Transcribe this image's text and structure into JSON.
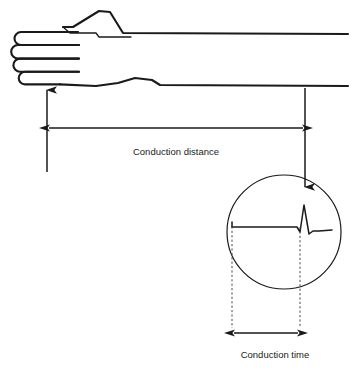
{
  "diagram": {
    "background_color": "#ffffff",
    "line_color": "#1a1a1a",
    "labels": {
      "conduction_distance": "Conduction distance",
      "conduction_time": "Conduction time"
    },
    "parts": {
      "hand_arm": "hand-and-forearm-outline",
      "stimulus_arrow": "left-upward-arrow",
      "recording_arrow": "right-downward-arrow",
      "distance_measure": "horizontal-double-arrow",
      "magnifier": "circle-waveform-inset",
      "waveform": "compound-muscle-action-potential-trace",
      "time_measure": "bottom-double-arrow",
      "time_markers": "dashed-vertical-lines"
    },
    "geometry": {
      "width": 353,
      "height": 376,
      "circle_center_x": 284,
      "circle_center_y": 232,
      "circle_radius": 57,
      "distance_arrow_y": 128,
      "distance_arrow_x1": 47,
      "distance_arrow_x2": 305,
      "time_arrow_y": 333,
      "time_arrow_x1": 232,
      "time_arrow_x2": 300,
      "baseline_y": 227
    }
  }
}
